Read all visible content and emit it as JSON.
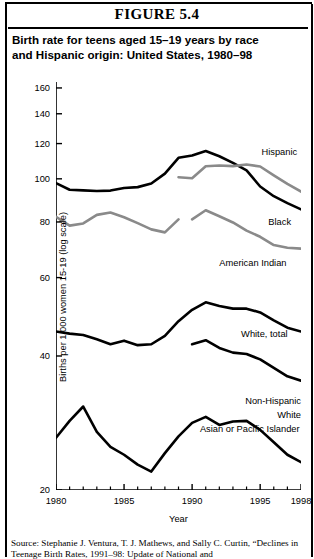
{
  "figure_number": "FIGURE 5.4",
  "title_line1": "Birth rate for teens aged 15–19 years by race",
  "title_line2": "and Hispanic origin: United States, 1980–98",
  "source_line1": "Source: Stephanie J. Ventura, T. J. Mathews, and Sally C. Curtin,",
  "source_line2": "“Declines in Teenage Birth Rates, 1991–98: Update of National and",
  "labels": {
    "hispanic": "Hispanic",
    "black": "Black",
    "american_indian": "American Indian",
    "white_total": "White, total",
    "non_hispanic_white_l1": "Non-Hispanic",
    "non_hispanic_white_l2": "White",
    "asian": "Asian or Pacific Islander"
  },
  "chart_data": {
    "type": "line",
    "xlabel": "Year",
    "ylabel": "Births per 1,000 women 15-19 (log scale)",
    "yscale": "log",
    "ylim": [
      20,
      165
    ],
    "xlim": [
      1980,
      1998
    ],
    "yticks": [
      20,
      40,
      60,
      80,
      100,
      120,
      140,
      160
    ],
    "xticks": [
      1980,
      1985,
      1990,
      1995,
      1998
    ],
    "xtick_labels": [
      "1980",
      "1985",
      "1990",
      "1995",
      "1998"
    ],
    "xminor": [
      1981,
      1982,
      1983,
      1984,
      1986,
      1987,
      1988,
      1989,
      1991,
      1992,
      1993,
      1994,
      1996,
      1997
    ],
    "grid": false,
    "legend": "inline-labels",
    "colors": {
      "black_series": "#000000",
      "gray_series": "#8a8a8a"
    },
    "series": [
      {
        "name": "Black",
        "color": "#000000",
        "width": 2.6,
        "x": [
          1980,
          1981,
          1982,
          1983,
          1984,
          1985,
          1986,
          1987,
          1988,
          1989,
          1990,
          1991,
          1992,
          1993,
          1994,
          1995,
          1996,
          1997,
          1998
        ],
        "values": [
          97.8,
          94.5,
          94.2,
          93.9,
          94.1,
          95.4,
          95.8,
          97.6,
          102.7,
          111.5,
          112.8,
          115.5,
          112.4,
          108.6,
          104.5,
          96.1,
          91.4,
          88.2,
          85.4
        ]
      },
      {
        "name": "Hispanic",
        "color": "#8a8a8a",
        "width": 2.6,
        "x": [
          1989,
          1990,
          1991,
          1992,
          1993,
          1994,
          1995,
          1996,
          1997,
          1998
        ],
        "values": [
          100.8,
          100.3,
          106.7,
          107.1,
          106.8,
          107.7,
          106.6,
          101.8,
          97.4,
          93.6
        ]
      },
      {
        "name": "American Indian",
        "color": "#8a8a8a",
        "width": 2.6,
        "segments": [
          {
            "x": [
              1980,
              1981,
              1982,
              1983,
              1984,
              1985,
              1986,
              1987,
              1988,
              1989
            ],
            "values": [
              82.2,
              78.5,
              79.4,
              83.0,
              84.0,
              82.0,
              79.5,
              77.0,
              75.8,
              81.1
            ]
          },
          {
            "x": [
              1990,
              1991,
              1992,
              1993,
              1994,
              1995,
              1996,
              1997,
              1998
            ],
            "values": [
              81.1,
              85.0,
              82.4,
              79.8,
              76.5,
              74.1,
              71.0,
              70.0,
              69.7
            ]
          }
        ]
      },
      {
        "name": "White, total",
        "color": "#000000",
        "width": 2.6,
        "x": [
          1980,
          1981,
          1982,
          1983,
          1984,
          1985,
          1986,
          1987,
          1988,
          1989,
          1990,
          1991,
          1992,
          1993,
          1994,
          1995,
          1996,
          1997,
          1998
        ],
        "values": [
          45.4,
          44.9,
          44.6,
          43.6,
          42.5,
          43.3,
          42.3,
          42.5,
          44.4,
          47.9,
          50.8,
          52.8,
          51.8,
          51.1,
          51.1,
          50.1,
          48.1,
          46.3,
          45.4
        ]
      },
      {
        "name": "Non-Hispanic White",
        "color": "#000000",
        "width": 2.6,
        "x": [
          1990,
          1991,
          1992,
          1993,
          1994,
          1995,
          1996,
          1997,
          1998
        ],
        "values": [
          42.5,
          43.4,
          41.7,
          40.7,
          40.4,
          39.3,
          37.6,
          36.0,
          35.2
        ]
      },
      {
        "name": "Asian or Pacific Islander",
        "color": "#000000",
        "width": 2.6,
        "x": [
          1980,
          1981,
          1982,
          1983,
          1984,
          1985,
          1986,
          1987,
          1988,
          1989,
          1990,
          1991,
          1992,
          1993,
          1994,
          1995,
          1996,
          1997,
          1998
        ],
        "values": [
          26.2,
          28.6,
          30.8,
          27.0,
          25.0,
          24.0,
          22.8,
          22.0,
          24.2,
          26.4,
          28.3,
          29.2,
          28.0,
          28.5,
          28.6,
          27.3,
          25.6,
          24.0,
          23.1
        ]
      }
    ]
  }
}
